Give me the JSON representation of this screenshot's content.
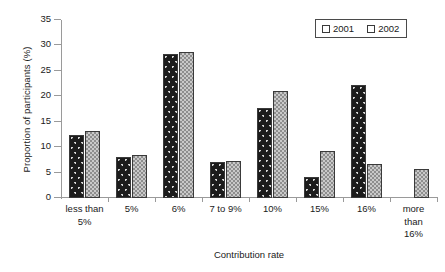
{
  "chart_data": {
    "type": "bar",
    "title": "",
    "xlabel": "Contribution rate",
    "ylabel": "Proportion of participants (%)",
    "categories": [
      "less than 5%",
      "5%",
      "6%",
      "7 to 9%",
      "10%",
      "15%",
      "16%",
      "more than 16%"
    ],
    "category_lines": [
      [
        "less than",
        "5%"
      ],
      [
        "5%"
      ],
      [
        "6%"
      ],
      [
        "7 to 9%"
      ],
      [
        "10%"
      ],
      [
        "15%"
      ],
      [
        "16%"
      ],
      [
        "more",
        "than",
        "16%"
      ]
    ],
    "series": [
      {
        "name": "2001",
        "values": [
          12.4,
          8.1,
          28.3,
          7.1,
          17.7,
          4.2,
          22.3,
          0
        ]
      },
      {
        "name": "2002",
        "values": [
          13.2,
          8.5,
          28.8,
          7.2,
          21.0,
          9.3,
          6.6,
          5.7
        ]
      }
    ],
    "ylim": [
      0,
      35
    ],
    "yticks": [
      0,
      5,
      10,
      15,
      20,
      25,
      30,
      35
    ],
    "ytick_labels": [
      "0",
      "5",
      "10",
      "15",
      "20",
      "25",
      "30",
      "35"
    ],
    "grid": false,
    "legend_position": "top-right",
    "colors": {
      "series_2001": "#1c1c1c",
      "series_2002": "#8e8e8e",
      "axis": "#9a9a9a",
      "text": "#1a1a1a"
    }
  },
  "legend": {
    "entries": [
      {
        "label": "2001",
        "swatch": "dark-speckled-swatch"
      },
      {
        "label": "2002",
        "swatch": "gray-checkered-swatch"
      }
    ]
  }
}
